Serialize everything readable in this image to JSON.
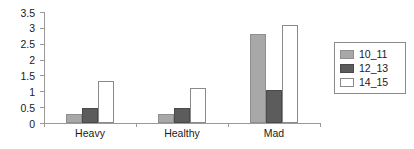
{
  "chart_data": {
    "type": "bar",
    "title": "",
    "subtitle": "",
    "xlabel": "",
    "ylabel": "",
    "categories": [
      "Heavy",
      "Healthy",
      "Mad"
    ],
    "series": [
      {
        "name": "10_11",
        "color": "#a8a8a8",
        "values": [
          0.27,
          0.27,
          2.82
        ]
      },
      {
        "name": "12_13",
        "color": "#5c5c5c",
        "values": [
          0.47,
          0.47,
          1.05
        ]
      },
      {
        "name": "14_15",
        "color": "#ffffff",
        "values": [
          1.33,
          1.1,
          3.1
        ]
      }
    ],
    "ylim": [
      0,
      3.5
    ],
    "yticks": [
      0,
      0.5,
      1,
      1.5,
      2,
      2.5,
      3,
      3.5
    ],
    "ytick_labels": [
      "0",
      "0.5",
      "1",
      "1.5",
      "2",
      "2.5",
      "3",
      "3.5"
    ],
    "grid": false,
    "legend_position": "right",
    "legend_entries": [
      "10_11",
      "12_13",
      "14_15"
    ],
    "annotations": [],
    "axis_color": "#9a9a9a"
  }
}
